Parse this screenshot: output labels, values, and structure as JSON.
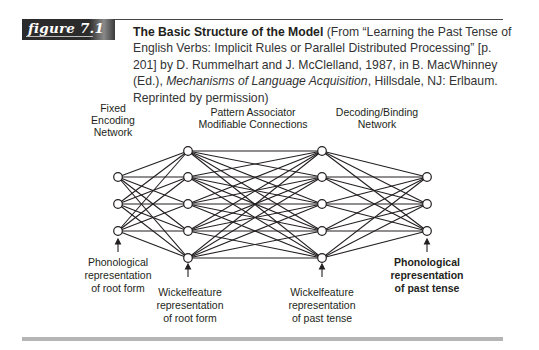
{
  "figure": {
    "label": "figure 7.1",
    "caption": {
      "title": "The Basic Structure of the Model",
      "text_before_italic": " (From “Learning the Past Tense of English Verbs: Implicit Rules or Parallel Distributed Processing” [p. 201] by D. Rummelhart and J. McClelland, 1987, in B. MacWhinney (Ed.), ",
      "italic": "Mechanisms of Language Acquisition",
      "text_after_italic": ", Hillsdale, NJ: Erlbaum. Reprinted by permission)"
    }
  },
  "diagram": {
    "top_labels": {
      "encoding": [
        "Fixed",
        "Encoding",
        "Network"
      ],
      "associator": [
        "Pattern Associator",
        "Modifiable Connections"
      ],
      "decoding": [
        "Decoding/Binding",
        "Network"
      ]
    },
    "bottom_labels": {
      "input": [
        "Phonological",
        "representation",
        "of root form"
      ],
      "hidden1": [
        "Wickelfeature",
        "representation",
        "of root form"
      ],
      "hidden2": [
        "Wickelfeature",
        "representation",
        "of past tense"
      ],
      "output": [
        "Phonological",
        "representation",
        "of past tense"
      ]
    },
    "layers": [
      {
        "name": "phonological-root",
        "nodes": 3
      },
      {
        "name": "wickelfeature-root",
        "nodes": 5
      },
      {
        "name": "wickelfeature-past",
        "nodes": 5
      },
      {
        "name": "phonological-past",
        "nodes": 3
      }
    ],
    "connectivity": "fully-connected between adjacent layers"
  }
}
